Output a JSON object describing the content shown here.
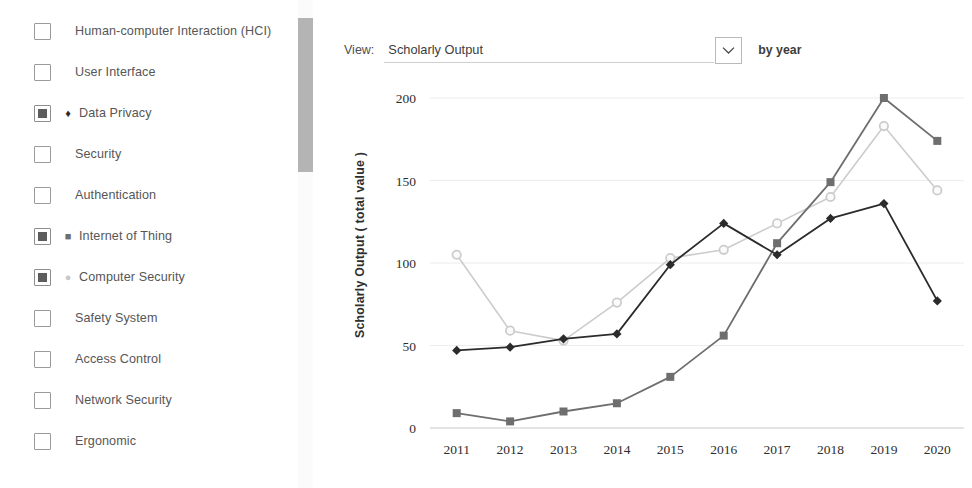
{
  "sidebar": {
    "topics": [
      {
        "label": "Human-computer Interaction (HCI)",
        "checked": false,
        "marker": ""
      },
      {
        "label": "User Interface",
        "checked": false,
        "marker": ""
      },
      {
        "label": "Data Privacy",
        "checked": true,
        "marker": "♦",
        "marker_color": "#2b2b2b"
      },
      {
        "label": "Security",
        "checked": false,
        "marker": ""
      },
      {
        "label": "Authentication",
        "checked": false,
        "marker": ""
      },
      {
        "label": "Internet of Thing",
        "checked": true,
        "marker": "■",
        "marker_color": "#6e6e6e"
      },
      {
        "label": "Computer Security",
        "checked": true,
        "marker": "●",
        "marker_color": "#c9c9c9"
      },
      {
        "label": "Safety System",
        "checked": false,
        "marker": ""
      },
      {
        "label": "Access Control",
        "checked": false,
        "marker": ""
      },
      {
        "label": "Network Security",
        "checked": false,
        "marker": ""
      },
      {
        "label": "Ergonomic",
        "checked": false,
        "marker": ""
      }
    ]
  },
  "controls": {
    "view_label": "View:",
    "view_value": "Scholarly Output",
    "chevron_icon": "chevron-down-icon",
    "by_year_label": "by year"
  },
  "chart_data": {
    "type": "line",
    "title": "",
    "xlabel": "",
    "ylabel": "Scholarly Output ( total value )",
    "categories": [
      "2011",
      "2012",
      "2013",
      "2014",
      "2015",
      "2016",
      "2017",
      "2018",
      "2019",
      "2020"
    ],
    "x": [
      2011,
      2012,
      2013,
      2014,
      2015,
      2016,
      2017,
      2018,
      2019,
      2020
    ],
    "ylim": [
      0,
      200
    ],
    "yticks": [
      0,
      50,
      100,
      150,
      200
    ],
    "grid": true,
    "legend": "sidebar-checkboxes",
    "series": [
      {
        "name": "Data Privacy",
        "color": "#2b2b2b",
        "marker": "diamond",
        "values": [
          47,
          49,
          54,
          57,
          99,
          124,
          105,
          127,
          136,
          77
        ]
      },
      {
        "name": "Internet of Thing",
        "color": "#6e6e6e",
        "marker": "square",
        "values": [
          9,
          4,
          10,
          15,
          31,
          56,
          112,
          149,
          200,
          174
        ]
      },
      {
        "name": "Computer Security",
        "color": "#cccccc",
        "marker": "circle",
        "values": [
          105,
          59,
          53,
          76,
          103,
          108,
          124,
          140,
          183,
          144
        ]
      }
    ]
  }
}
